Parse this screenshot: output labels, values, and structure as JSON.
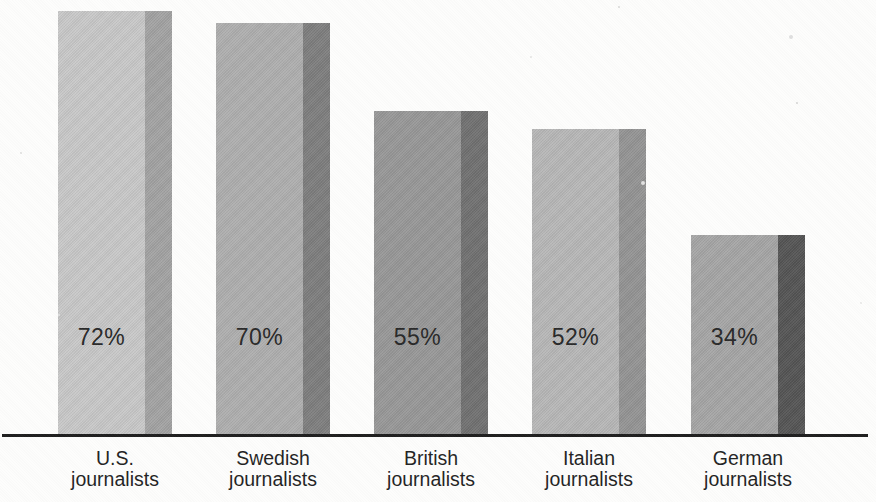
{
  "chart_data": {
    "type": "bar",
    "orientation": "vertical",
    "bar_style": "3d-extruded grayscale, scanned print figure",
    "title": "",
    "xlabel": "",
    "ylabel": "",
    "ylim": [
      0,
      75
    ],
    "grid": false,
    "legend": null,
    "categories": [
      "U.S. journalists",
      "Swedish journalists",
      "British journalists",
      "Italian journalists",
      "German journalists"
    ],
    "category_lines": [
      [
        "U.S.",
        "journalists"
      ],
      [
        "Swedish",
        "journalists"
      ],
      [
        "British",
        "journalists"
      ],
      [
        "Italian",
        "journalists"
      ],
      [
        "German",
        "journalists"
      ]
    ],
    "values": [
      72,
      70,
      55,
      52,
      34
    ],
    "value_labels": [
      "72%",
      "70%",
      "55%",
      "52%",
      "34%"
    ],
    "colors": {
      "background": "#fdfdfc",
      "axis": "#1c1c1c",
      "value_text": "#272727",
      "category_text": "#1f1f1f",
      "bars": [
        {
          "front": "#c7c7c7",
          "side": "#a1a1a1"
        },
        {
          "front": "#adadad",
          "side": "#7c7c7c"
        },
        {
          "front": "#969696",
          "side": "#6f6f6f"
        },
        {
          "front": "#b6b6b6",
          "side": "#929292"
        },
        {
          "front": "#a4a4a4",
          "side": "#525252"
        }
      ]
    }
  }
}
